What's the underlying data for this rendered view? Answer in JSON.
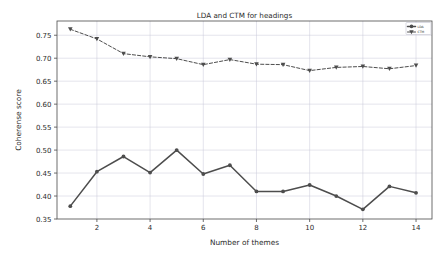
{
  "chart_data": {
    "type": "line",
    "title": "LDA and CTM for headings",
    "xlabel": "Number of themes",
    "ylabel": "Coherense score",
    "x": [
      1,
      2,
      3,
      4,
      5,
      6,
      7,
      8,
      9,
      10,
      11,
      12,
      13,
      14
    ],
    "xlim": [
      0.5,
      14.6
    ],
    "ylim": [
      0.35,
      0.781
    ],
    "xticks": [
      2,
      4,
      6,
      8,
      10,
      12,
      14
    ],
    "xticklabels": [
      "2",
      "4",
      "6",
      "8",
      "10",
      "12",
      "14"
    ],
    "yticks": [
      0.35,
      0.4,
      0.45,
      0.5,
      0.55,
      0.6,
      0.65,
      0.7,
      0.75
    ],
    "yticklabels": [
      "0.35",
      "0.40",
      "0.45",
      "0.50",
      "0.55",
      "0.60",
      "0.65",
      "0.70",
      "0.75"
    ],
    "grid": true,
    "grid_color": "#c8c8d8",
    "legend_position": "upper right",
    "series": [
      {
        "name": "LDA",
        "marker": "circle",
        "linestyle": "solid",
        "color": "#4d4d4d",
        "values": [
          0.378,
          0.453,
          0.486,
          0.451,
          0.5,
          0.448,
          0.467,
          0.41,
          0.41,
          0.424,
          0.4,
          0.371,
          0.421,
          0.407
        ]
      },
      {
        "name": "CTM",
        "marker": "triangle-down",
        "linestyle": "dashed",
        "color": "#4d4d4d",
        "values": [
          0.763,
          0.742,
          0.71,
          0.703,
          0.699,
          0.686,
          0.697,
          0.687,
          0.686,
          0.673,
          0.68,
          0.682,
          0.677,
          0.684
        ]
      }
    ]
  },
  "legend": {
    "entries": [
      {
        "label": "LDA"
      },
      {
        "label": "CTM"
      }
    ]
  }
}
